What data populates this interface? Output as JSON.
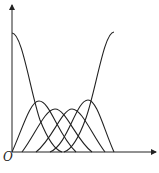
{
  "diagram": {
    "type": "basis-function-curves",
    "origin_label": "O",
    "stroke_color": "#222222",
    "axes": {
      "x_axis": {
        "from": [
          12,
          152
        ],
        "to": [
          157,
          152
        ]
      },
      "y_axis": {
        "from": [
          12,
          152
        ],
        "to": [
          12,
          4
        ]
      }
    },
    "curves": [
      {
        "name": "basis-0",
        "kind": "decreasing",
        "start": [
          12,
          33
        ],
        "end": [
          62,
          152
        ]
      },
      {
        "name": "basis-1",
        "peak": [
          39,
          101
        ],
        "start": [
          12,
          152
        ],
        "end": [
          76,
          152
        ]
      },
      {
        "name": "basis-2",
        "peak": [
          55,
          109
        ],
        "start": [
          22,
          152
        ],
        "end": [
          92,
          152
        ]
      },
      {
        "name": "basis-3",
        "peak": [
          72,
          109
        ],
        "start": [
          36,
          152
        ],
        "end": [
          105,
          152
        ]
      },
      {
        "name": "basis-4",
        "peak": [
          88,
          100
        ],
        "start": [
          50,
          152
        ],
        "end": [
          114,
          152
        ]
      },
      {
        "name": "basis-5",
        "kind": "increasing",
        "start": [
          64,
          152
        ],
        "end": [
          114,
          32
        ]
      }
    ]
  }
}
